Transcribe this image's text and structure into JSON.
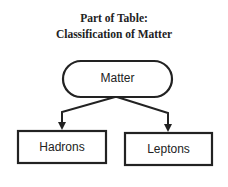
{
  "title": {
    "line1": "Part of Table:",
    "line2": "Classification of Matter"
  },
  "diagram": {
    "root": {
      "label": "Matter",
      "shape": "rounded-pill"
    },
    "children": [
      {
        "label": "Hadrons",
        "shape": "rectangle"
      },
      {
        "label": "Leptons",
        "shape": "rectangle"
      }
    ],
    "edges": [
      {
        "from": "Matter",
        "to": "Hadrons",
        "arrow": true
      },
      {
        "from": "Matter",
        "to": "Leptons",
        "arrow": true
      }
    ],
    "stroke_color": "#222222"
  }
}
